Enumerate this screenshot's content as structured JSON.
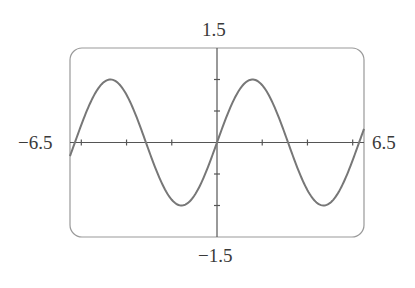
{
  "chart_data": {
    "type": "line",
    "title": "",
    "function": "y = sin(x)",
    "xlabel": "",
    "ylabel": "",
    "xlim": [
      -6.5,
      6.5
    ],
    "ylim": [
      -1.5,
      1.5
    ],
    "x_tick_spacing": 2,
    "y_tick_spacing": 0.5,
    "x_ticks": [
      -6,
      -4,
      -2,
      2,
      4,
      6
    ],
    "y_ticks": [
      -1,
      -0.5,
      0.5,
      1
    ],
    "grid": false,
    "window_labels": {
      "xmin": "−6.5",
      "xmax": "6.5",
      "ymin": "−1.5",
      "ymax": "1.5"
    },
    "series": [
      {
        "name": "sin(x)",
        "color": "#777777",
        "x": [
          -6.5,
          -6,
          -5.5,
          -5,
          -4.712,
          -4.5,
          -4,
          -3.5,
          -3.1416,
          -3,
          -2.5,
          -2,
          -1.5708,
          -1.5,
          -1,
          -0.5,
          0,
          0.5,
          1,
          1.5,
          1.5708,
          2,
          2.5,
          3,
          3.1416,
          3.5,
          4,
          4.5,
          4.712,
          5,
          5.5,
          6,
          6.5
        ],
        "values": [
          -0.215,
          0.279,
          0.706,
          0.959,
          1.0,
          0.978,
          0.757,
          0.351,
          0.0,
          -0.141,
          -0.598,
          -0.909,
          -1.0,
          -0.997,
          -0.841,
          -0.479,
          0.0,
          0.479,
          0.841,
          0.997,
          1.0,
          0.909,
          0.598,
          0.141,
          0.0,
          -0.351,
          -0.757,
          -0.978,
          -1.0,
          -0.959,
          -0.706,
          -0.279,
          0.215
        ]
      }
    ],
    "legend": null
  },
  "colors": {
    "frame": "#888888",
    "axis": "#555555",
    "curve": "#777777"
  }
}
